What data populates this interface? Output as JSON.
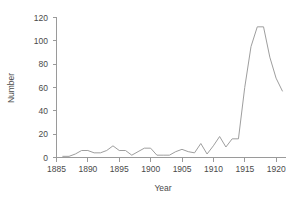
{
  "chart_data": {
    "type": "line",
    "title": "",
    "xlabel": "Year",
    "ylabel": "Number",
    "xlim": [
      1885,
      1921.5
    ],
    "ylim": [
      0,
      120
    ],
    "xticks": [
      1885,
      1890,
      1895,
      1900,
      1905,
      1910,
      1915,
      1920
    ],
    "yticks": [
      0,
      20,
      40,
      60,
      80,
      100,
      120
    ],
    "grid": false,
    "legend": false,
    "line_color": "#9e9e9e",
    "x": [
      1886,
      1887,
      1888,
      1889,
      1890,
      1891,
      1892,
      1893,
      1894,
      1895,
      1896,
      1897,
      1898,
      1899,
      1900,
      1901,
      1902,
      1903,
      1904,
      1905,
      1906,
      1907,
      1908,
      1909,
      1910,
      1911,
      1912,
      1913,
      1914,
      1915,
      1916,
      1917,
      1918,
      1919,
      1920,
      1921
    ],
    "values": [
      1,
      1,
      3,
      6,
      6,
      4,
      4,
      6,
      10,
      6,
      6,
      2,
      5,
      8,
      8,
      2,
      2,
      2,
      5,
      7,
      5,
      4,
      12,
      3,
      10,
      18,
      9,
      16,
      16,
      60,
      95,
      112,
      112,
      86,
      68,
      57
    ],
    "series": [
      {
        "name": "Number",
        "values": [
          1,
          1,
          3,
          6,
          6,
          4,
          4,
          6,
          10,
          6,
          6,
          2,
          5,
          8,
          8,
          2,
          2,
          2,
          5,
          7,
          5,
          4,
          12,
          3,
          10,
          18,
          9,
          16,
          16,
          60,
          95,
          112,
          112,
          86,
          68,
          57
        ]
      }
    ]
  }
}
